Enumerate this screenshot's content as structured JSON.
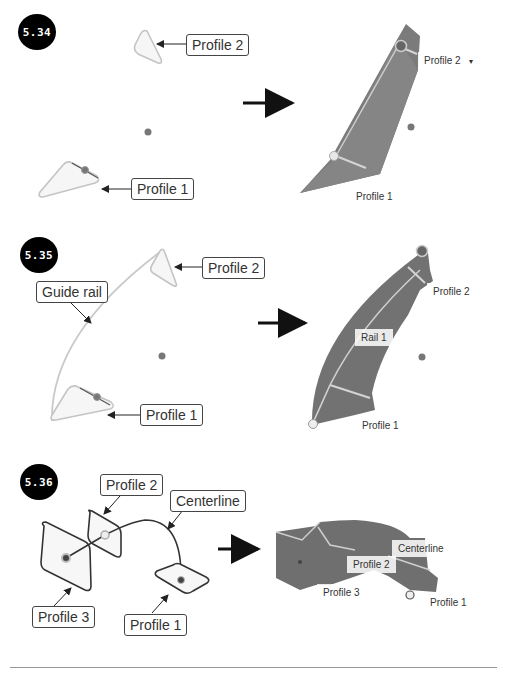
{
  "figures": [
    {
      "id": "5.34",
      "badge": "5.34",
      "callouts": {
        "profile2": "Profile 2",
        "profile1": "Profile 1"
      },
      "result_labels": {
        "profile2": "Profile 2",
        "profile2_dropdown": "▾",
        "profile1": "Profile 1"
      }
    },
    {
      "id": "5.35",
      "badge": "5.35",
      "callouts": {
        "profile2": "Profile 2",
        "guide_rail": "Guide rail",
        "profile1": "Profile 1"
      },
      "result_labels": {
        "profile2": "Profile 2",
        "rail1": "Rail 1",
        "profile1": "Profile 1"
      }
    },
    {
      "id": "5.36",
      "badge": "5.36",
      "callouts": {
        "profile2": "Profile 2",
        "centerline": "Centerline",
        "profile3": "Profile 3",
        "profile1": "Profile 1"
      },
      "result_labels": {
        "centerline": "Centerline",
        "profile2": "Profile 2",
        "profile3": "Profile 3",
        "profile1": "Profile 1"
      }
    }
  ],
  "colors": {
    "solid": "#7a7a7a",
    "solid_dark": "#5e5e5e",
    "edge": "#d8d8d8",
    "sketch": "#bdbdbd",
    "badge_bg": "#000000"
  }
}
